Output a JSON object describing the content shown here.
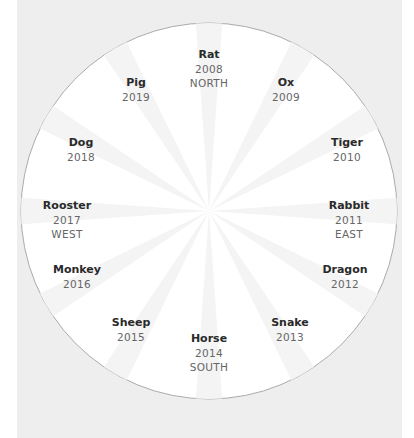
{
  "diagram": {
    "type": "zodiac-wheel",
    "colors": {
      "background": "#eeeeee",
      "circle": "#ffffff",
      "circle_border": "#aaaaaa",
      "ray": "#f4f4f4",
      "name_text": "#2a2a2a",
      "sub_text": "#666666"
    },
    "signs": [
      {
        "name": "Rat",
        "year": "2008",
        "direction": "NORTH"
      },
      {
        "name": "Ox",
        "year": "2009",
        "direction": ""
      },
      {
        "name": "Tiger",
        "year": "2010",
        "direction": ""
      },
      {
        "name": "Rabbit",
        "year": "2011",
        "direction": "EAST"
      },
      {
        "name": "Dragon",
        "year": "2012",
        "direction": ""
      },
      {
        "name": "Snake",
        "year": "2013",
        "direction": ""
      },
      {
        "name": "Horse",
        "year": "2014",
        "direction": "SOUTH"
      },
      {
        "name": "Sheep",
        "year": "2015",
        "direction": ""
      },
      {
        "name": "Monkey",
        "year": "2016",
        "direction": ""
      },
      {
        "name": "Rooster",
        "year": "2017",
        "direction": "WEST"
      },
      {
        "name": "Dog",
        "year": "2018",
        "direction": ""
      },
      {
        "name": "Pig",
        "year": "2019",
        "direction": ""
      }
    ]
  }
}
